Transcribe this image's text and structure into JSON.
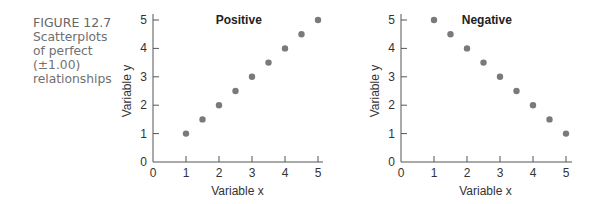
{
  "figure": {
    "label": "FIGURE 12.7",
    "caption_lines": [
      "Scatterplots",
      "of perfect",
      "(±1.00)",
      "relationships"
    ]
  },
  "colors": {
    "point": "#7a7a7a",
    "axis": "#555555",
    "caption": "#6f6f6f"
  },
  "chart_data": [
    {
      "type": "scatter",
      "title": "Positive",
      "xlabel": "Variable x",
      "ylabel": "Variable y",
      "xlim": [
        0,
        5
      ],
      "ylim": [
        0,
        5
      ],
      "xticks": [
        0,
        1,
        2,
        3,
        4,
        5
      ],
      "yticks": [
        0,
        1,
        2,
        3,
        4,
        5
      ],
      "grid": false,
      "x": [
        1,
        1.5,
        2,
        2.5,
        3,
        3.5,
        4,
        4.5,
        5
      ],
      "y": [
        1,
        1.5,
        2,
        2.5,
        3,
        3.5,
        4,
        4.5,
        5
      ]
    },
    {
      "type": "scatter",
      "title": "Negative",
      "xlabel": "Variable x",
      "ylabel": "Variable y",
      "xlim": [
        0,
        5
      ],
      "ylim": [
        0,
        5
      ],
      "xticks": [
        0,
        1,
        2,
        3,
        4,
        5
      ],
      "yticks": [
        0,
        1,
        2,
        3,
        4,
        5
      ],
      "grid": false,
      "x": [
        1,
        1.5,
        2,
        2.5,
        3,
        3.5,
        4,
        4.5,
        5
      ],
      "y": [
        5,
        4.5,
        4,
        3.5,
        3,
        2.5,
        2,
        1.5,
        1
      ]
    }
  ]
}
